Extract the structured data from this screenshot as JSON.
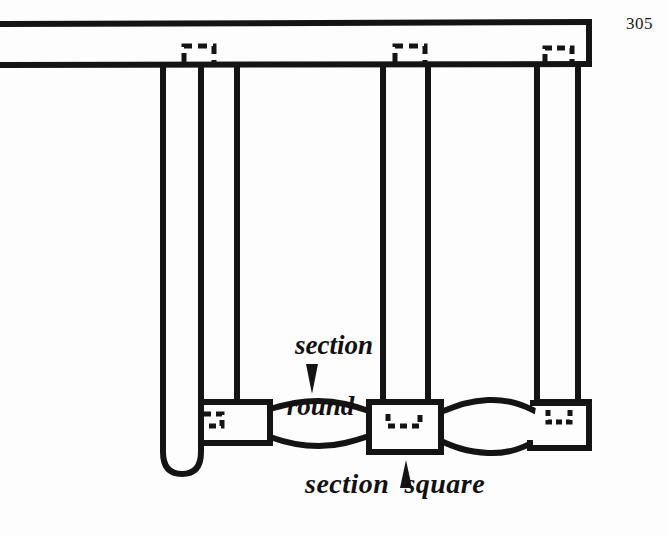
{
  "page": {
    "number": "305",
    "background_color": "#fdfdfd",
    "ink_color": "#141414"
  },
  "figure": {
    "type": "line-drawing",
    "annotations": [
      {
        "id": "section-round",
        "text_line_1": "section",
        "text_line_2": "round",
        "arrow": "down",
        "points_to": "turned round spindle section of lower stretcher"
      },
      {
        "id": "section-square",
        "text": "section  square",
        "arrow": "up",
        "points_to": "square block at center of lower stretcher"
      }
    ],
    "parts": [
      {
        "name": "top-rail",
        "shape": "horizontal-beam"
      },
      {
        "name": "left-leg",
        "shape": "rounded-bottom-post"
      },
      {
        "name": "left-post",
        "shape": "vertical-post"
      },
      {
        "name": "center-post",
        "shape": "vertical-post"
      },
      {
        "name": "right-post",
        "shape": "vertical-post"
      },
      {
        "name": "left-block",
        "shape": "square-block"
      },
      {
        "name": "center-block",
        "shape": "square-block"
      },
      {
        "name": "right-block",
        "shape": "square-block"
      },
      {
        "name": "left-spindle",
        "shape": "turned-round-lens"
      },
      {
        "name": "right-spindle",
        "shape": "turned-round-lens"
      }
    ],
    "hidden_tenons": [
      {
        "name": "tenon-top-left"
      },
      {
        "name": "tenon-top-center"
      },
      {
        "name": "tenon-top-right"
      },
      {
        "name": "tenon-bottom-left"
      },
      {
        "name": "tenon-bottom-center"
      },
      {
        "name": "tenon-bottom-right"
      }
    ]
  }
}
